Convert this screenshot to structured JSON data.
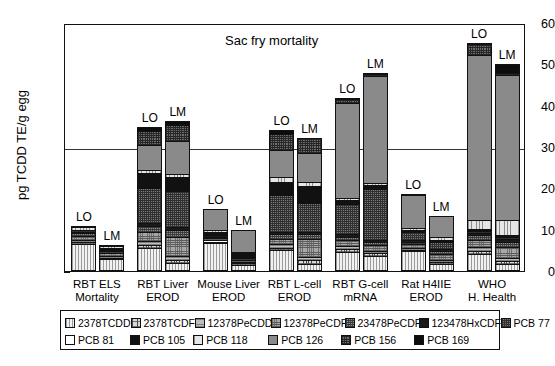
{
  "chart_data": {
    "type": "bar",
    "subtype": "stacked",
    "title": "Sac fry mortality",
    "xlabel": "",
    "ylabel": "pg TCDD TE/g egg",
    "ylim": [
      0,
      60
    ],
    "yticks": [
      0,
      10,
      20,
      30,
      40,
      50,
      60
    ],
    "ytick_minor_step": 5,
    "grid": false,
    "reference_line": 30,
    "legend_position": "bottom",
    "categories": [
      "RBT ELS Mortality",
      "RBT Liver EROD",
      "Mouse Liver EROD",
      "RBT L-cell EROD",
      "RBT G-cell mRNA",
      "Rat H4IIE EROD",
      "WHO H. Health"
    ],
    "category_lines": [
      [
        "RBT ELS",
        "Mortality"
      ],
      [
        "RBT Liver",
        "EROD"
      ],
      [
        "Mouse Liver",
        "EROD"
      ],
      [
        "RBT L-cell",
        "EROD"
      ],
      [
        "RBT G-cell",
        "mRNA"
      ],
      [
        "Rat H4IIE",
        "EROD"
      ],
      [
        "WHO",
        "H. Health"
      ]
    ],
    "sample_labels": [
      "LO",
      "LM"
    ],
    "congeners": [
      "2378TCDD",
      "2378TCDF",
      "12378PeCDD",
      "12378PeCDF",
      "23478PeCDF",
      "123478HxCDF",
      "PCB 77",
      "PCB 81",
      "PCB 105",
      "PCB 118",
      "PCB 126",
      "PCB 156",
      "PCB 169"
    ],
    "totals": {
      "LO": [
        11.0,
        34.8,
        15.0,
        34.0,
        41.8,
        18.6,
        55.2
      ],
      "LM": [
        6.4,
        36.2,
        10.0,
        32.2,
        47.8,
        13.3,
        50.2
      ]
    },
    "stacks": {
      "RBT ELS Mortality": {
        "LO": [
          6.3,
          0.5,
          0.5,
          1.0,
          0.6,
          0.3,
          0.4,
          0.0,
          0.2,
          0.6,
          0.4,
          0.2,
          0.0
        ],
        "LM": [
          2.6,
          0.4,
          0.4,
          0.7,
          0.5,
          0.3,
          0.3,
          0.0,
          0.2,
          0.5,
          0.3,
          0.2,
          0.0
        ]
      },
      "RBT Liver EROD": {
        "LO": [
          5.3,
          0.8,
          1.0,
          2.2,
          1.4,
          0.6,
          8.5,
          0.0,
          3.6,
          0.9,
          6.0,
          3.3,
          1.2
        ],
        "LM": [
          1.6,
          0.9,
          0.8,
          4.7,
          1.6,
          0.8,
          8.6,
          0.0,
          3.5,
          0.8,
          7.9,
          3.8,
          1.2
        ]
      },
      "Mouse Liver EROD": {
        "LO": [
          6.6,
          0.3,
          0.3,
          0.5,
          0.4,
          0.3,
          0.3,
          0.0,
          0.6,
          0.4,
          5.0,
          0.3,
          0.0
        ],
        "LM": [
          1.3,
          0.3,
          0.3,
          0.5,
          0.4,
          0.3,
          0.4,
          0.0,
          0.5,
          0.3,
          5.4,
          0.3,
          0.0
        ]
      },
      "RBT L-cell EROD": {
        "LO": [
          4.8,
          0.6,
          0.9,
          1.1,
          1.4,
          0.5,
          8.8,
          0.0,
          3.2,
          1.2,
          6.6,
          3.7,
          1.2
        ],
        "LM": [
          1.4,
          1.0,
          0.8,
          4.2,
          1.2,
          0.7,
          6.9,
          0.0,
          4.1,
          1.0,
          7.1,
          3.6,
          0.2
        ]
      },
      "RBT G-cell mRNA": {
        "LO": [
          4.3,
          0.7,
          0.8,
          1.5,
          0.7,
          0.6,
          7.4,
          0.0,
          0.9,
          0.6,
          23.0,
          0.9,
          0.4
        ],
        "LM": [
          3.4,
          0.6,
          0.7,
          1.4,
          0.6,
          0.5,
          12.5,
          0.0,
          0.8,
          0.5,
          26.0,
          0.5,
          0.3
        ]
      },
      "Rat H4IIE EROD": {
        "LO": [
          4.5,
          0.4,
          0.5,
          0.8,
          0.6,
          0.4,
          2.1,
          0.0,
          0.4,
          0.5,
          8.0,
          0.4,
          0.0
        ],
        "LM": [
          1.4,
          0.5,
          0.6,
          1.4,
          0.7,
          0.5,
          1.7,
          0.0,
          0.5,
          0.6,
          5.3,
          0.1,
          0.0
        ]
      },
      "WHO H. Health": {
        "LO": [
          3.9,
          0.7,
          1.0,
          1.6,
          1.2,
          0.6,
          0.4,
          0.0,
          0.5,
          2.2,
          39.9,
          2.6,
          0.6
        ],
        "LM": [
          1.4,
          0.7,
          0.9,
          2.5,
          1.3,
          0.6,
          0.5,
          0.0,
          0.6,
          3.7,
          34.9,
          0.6,
          2.5
        ]
      }
    }
  },
  "legend": {
    "row1": [
      "2378TCDD",
      "2378TCDF",
      "12378PeCDD",
      "12378PeCDF",
      "23478PeCDF",
      "123478HxCDF",
      "PCB 77"
    ],
    "row2": [
      "PCB 81",
      "PCB 105",
      "PCB 118",
      "PCB 126",
      "PCB 156",
      "PCB 169"
    ]
  },
  "axis": {
    "y_title": "pg TCDD TE/g egg",
    "y_labels": [
      "60",
      "50",
      "40",
      "30",
      "20",
      "10",
      "0"
    ]
  },
  "colors": {
    "2378TCDD": "#f2f2f2",
    "2378TCDF": "#d9d9d9",
    "12378PeCDD": "#bdbdbd",
    "12378PeCDF": "#a8a8a8",
    "23478PeCDF": "#8f8f8f",
    "123478HxCDF": "#1a1a1a",
    "PCB 77": "#7a7a7a",
    "PCB 81": "#ffffff",
    "PCB 105": "#111111",
    "PCB 118": "#e6e6e6",
    "PCB 126": "#8a8a8a",
    "PCB 156": "#6d6d6d",
    "PCB 169": "#0d0d0d",
    "axis": "#111111"
  }
}
